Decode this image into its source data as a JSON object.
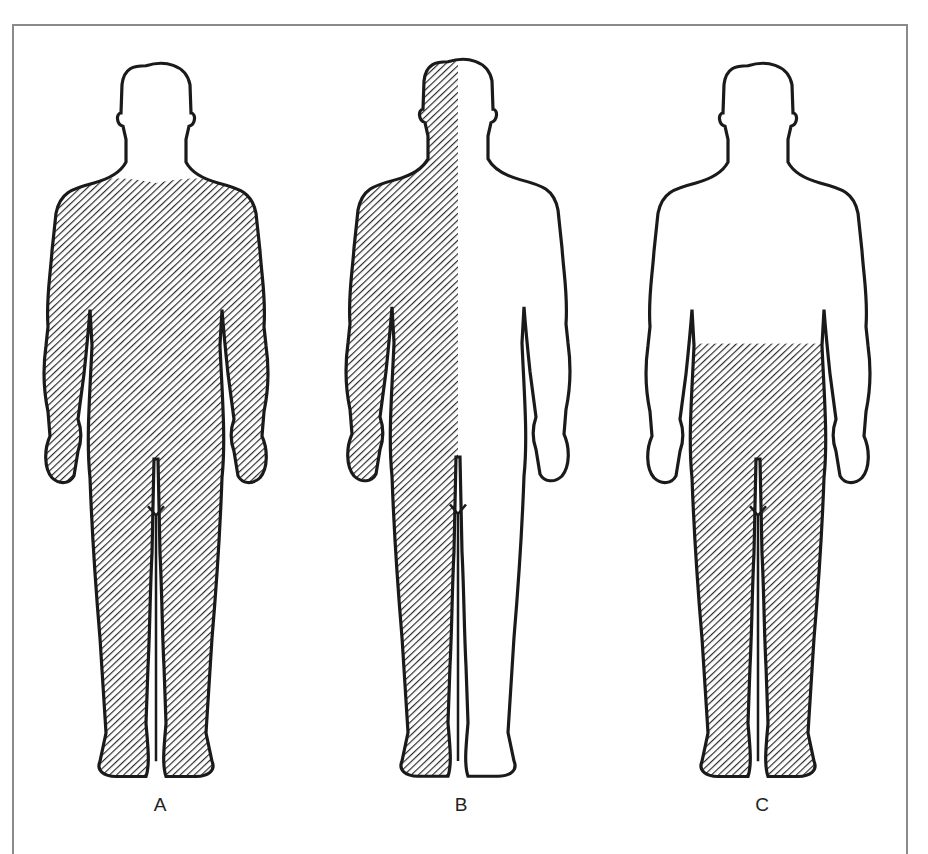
{
  "figure": {
    "panels": [
      {
        "label": "A",
        "description": "Front-facing body figure, entire body hatched except head, neck and upper chest/shoulder yoke"
      },
      {
        "label": "B",
        "description": "Back-facing body figure, left half of body (including head) hatched, right half unshaded"
      },
      {
        "label": "C",
        "description": "Back-facing body figure, hatched from waist down including legs"
      }
    ],
    "colors": {
      "outline": "#1a1a1a",
      "hatch": "#2a2a2a",
      "frame": "#8a8a8a",
      "background": "#ffffff"
    }
  }
}
